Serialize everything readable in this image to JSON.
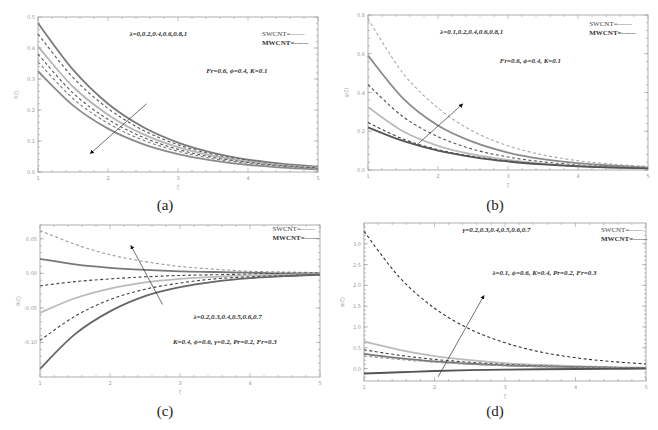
{
  "figure": {
    "panels": [
      {
        "id": "a",
        "caption": "(a)"
      },
      {
        "id": "b",
        "caption": "(b)"
      },
      {
        "id": "c",
        "caption": "(c)"
      },
      {
        "id": "d",
        "caption": "(d)"
      }
    ]
  },
  "chart_data": [
    {
      "panel": "a",
      "type": "line",
      "title": "",
      "xlabel": "ζ",
      "ylabel": "f(ζ)",
      "xlim": [
        1,
        5
      ],
      "ylim": [
        0.0,
        0.5
      ],
      "xticks": [
        "1",
        "2",
        "3",
        "4",
        "5"
      ],
      "yticks": [
        "0.0",
        "0.1",
        "0.2",
        "0.3",
        "0.4",
        "0.5"
      ],
      "annotation_top": "λ=0,0.2,0.4,0.6,0.8,1",
      "annotation_params": "Fr=0.6, ϕ=0.4, K=0.1",
      "legend": [
        "SWCNT=——",
        "MWCNT=------"
      ],
      "arrow": {
        "from": [
          2.55,
          0.22
        ],
        "to": [
          1.75,
          0.06
        ],
        "direction": "decreasing"
      },
      "x": [
        1,
        1.5,
        2,
        2.5,
        3,
        3.5,
        4,
        4.5,
        5
      ],
      "series": [
        {
          "name": "SWCNT λ=0",
          "style": "solid",
          "color": "#7a7a7a",
          "values": [
            0.48,
            0.33,
            0.22,
            0.145,
            0.095,
            0.062,
            0.04,
            0.026,
            0.017
          ]
        },
        {
          "name": "MWCNT λ=0",
          "style": "dashed",
          "color": "#555555",
          "values": [
            0.445,
            0.305,
            0.205,
            0.135,
            0.088,
            0.057,
            0.037,
            0.024,
            0.015
          ]
        },
        {
          "name": "SWCNT λ=0.4",
          "style": "solid",
          "color": "#b5b5b5",
          "values": [
            0.405,
            0.275,
            0.185,
            0.122,
            0.08,
            0.052,
            0.034,
            0.022,
            0.014
          ]
        },
        {
          "name": "MWCNT λ=0.4",
          "style": "dashed",
          "color": "#555555",
          "values": [
            0.38,
            0.255,
            0.17,
            0.112,
            0.073,
            0.047,
            0.031,
            0.02,
            0.013
          ]
        },
        {
          "name": "MWCNT λ=0.8",
          "style": "dashed",
          "color": "#777777",
          "values": [
            0.355,
            0.237,
            0.157,
            0.103,
            0.067,
            0.043,
            0.028,
            0.018,
            0.011
          ]
        },
        {
          "name": "SWCNT λ=1",
          "style": "solid",
          "color": "#8a8a8a",
          "values": [
            0.325,
            0.215,
            0.14,
            0.09,
            0.058,
            0.037,
            0.023,
            0.014,
            0.008
          ]
        }
      ]
    },
    {
      "panel": "b",
      "type": "line",
      "title": "",
      "xlabel": "ζ",
      "ylabel": "g(ζ)",
      "xlim": [
        1,
        5
      ],
      "ylim": [
        0.0,
        0.8
      ],
      "xticks": [
        "1",
        "2",
        "3",
        "4",
        "5"
      ],
      "yticks": [
        "0.0",
        "0.2",
        "0.4",
        "0.6",
        "0.8"
      ],
      "annotation_top": "λ=0.1,0.2,0.4,0.6,0.8,1",
      "annotation_params": "Fr=0.6, ϕ=0.4, K=0.1",
      "legend": [
        "SWCNT=——",
        "MWCNT=------"
      ],
      "arrow": {
        "from": [
          1.7,
          0.13
        ],
        "to": [
          2.35,
          0.34
        ],
        "direction": "increasing"
      },
      "x": [
        1,
        1.5,
        2,
        2.5,
        3,
        3.5,
        4,
        4.5,
        5
      ],
      "series": [
        {
          "name": "MWCNT λ=1",
          "style": "dashed",
          "color": "#aaaaaa",
          "values": [
            0.78,
            0.5,
            0.32,
            0.2,
            0.125,
            0.078,
            0.048,
            0.03,
            0.018
          ]
        },
        {
          "name": "SWCNT λ=1",
          "style": "solid",
          "color": "#8a8a8a",
          "values": [
            0.59,
            0.37,
            0.23,
            0.145,
            0.09,
            0.056,
            0.035,
            0.022,
            0.013
          ]
        },
        {
          "name": "MWCNT λ=0.6",
          "style": "dashed",
          "color": "#555555",
          "values": [
            0.44,
            0.275,
            0.172,
            0.107,
            0.067,
            0.042,
            0.026,
            0.017,
            0.011
          ]
        },
        {
          "name": "SWCNT λ=0.4",
          "style": "solid",
          "color": "#bbbbbb",
          "values": [
            0.325,
            0.2,
            0.125,
            0.08,
            0.052,
            0.033,
            0.021,
            0.014,
            0.009
          ]
        },
        {
          "name": "MWCNT λ=0.2",
          "style": "dashed",
          "color": "#444444",
          "values": [
            0.245,
            0.16,
            0.105,
            0.07,
            0.046,
            0.03,
            0.02,
            0.013,
            0.009
          ]
        },
        {
          "name": "SWCNT λ=0.1",
          "style": "solid",
          "color": "#555555",
          "values": [
            0.22,
            0.15,
            0.1,
            0.067,
            0.044,
            0.029,
            0.019,
            0.013,
            0.008
          ]
        }
      ]
    },
    {
      "panel": "c",
      "type": "line",
      "title": "",
      "xlabel": "ζ",
      "ylabel": "θ(ζ)",
      "xlim": [
        1,
        5
      ],
      "ylim": [
        -0.15,
        0.07
      ],
      "xticks": [
        "1",
        "2",
        "3",
        "4",
        "5"
      ],
      "yticks": [
        "0.05",
        "0.00",
        "-0.05",
        "-0.10"
      ],
      "annotation_top": "λ=0.2,0.3,0.4,0.5,0.6,0.7",
      "annotation_params": "K=0.4, ϕ=0.6, γ=0.2, Pr=0.2, Fr=0.3",
      "legend": [
        "SWCNT=——",
        "MWCNT=------"
      ],
      "arrow": {
        "from": [
          2.75,
          -0.045
        ],
        "to": [
          2.3,
          0.04
        ],
        "direction": "increasing"
      },
      "x": [
        1,
        1.5,
        2,
        2.5,
        3,
        3.5,
        4,
        4.5,
        5
      ],
      "series": [
        {
          "name": "MWCNT λ=0.7",
          "style": "dashed",
          "color": "#999999",
          "values": [
            0.062,
            0.042,
            0.027,
            0.017,
            0.01,
            0.006,
            0.003,
            0.002,
            0.001
          ]
        },
        {
          "name": "SWCNT λ=0.6",
          "style": "solid",
          "color": "#777777",
          "values": [
            0.021,
            0.013,
            0.008,
            0.005,
            0.003,
            0.002,
            0.001,
            0.0,
            0.0
          ]
        },
        {
          "name": "MWCNT λ=0.5",
          "style": "dashed",
          "color": "#444444",
          "values": [
            -0.018,
            -0.012,
            -0.008,
            -0.005,
            -0.003,
            -0.002,
            -0.001,
            0.0,
            0.0
          ]
        },
        {
          "name": "SWCNT λ=0.4",
          "style": "solid",
          "color": "#bbbbbb",
          "values": [
            -0.057,
            -0.036,
            -0.022,
            -0.013,
            -0.008,
            -0.005,
            -0.003,
            -0.002,
            -0.001
          ]
        },
        {
          "name": "MWCNT λ=0.3",
          "style": "dashed",
          "color": "#444444",
          "values": [
            -0.097,
            -0.062,
            -0.038,
            -0.023,
            -0.014,
            -0.008,
            -0.005,
            -0.003,
            -0.002
          ]
        },
        {
          "name": "SWCNT λ=0.2",
          "style": "solid",
          "color": "#666666",
          "values": [
            -0.138,
            -0.088,
            -0.055,
            -0.033,
            -0.02,
            -0.012,
            -0.007,
            -0.004,
            -0.002
          ]
        }
      ]
    },
    {
      "panel": "d",
      "type": "line",
      "title": "",
      "xlabel": "ζ",
      "ylabel": "ϕ(ζ)",
      "xlim": [
        1,
        5
      ],
      "ylim": [
        -0.3,
        3.5
      ],
      "xticks": [
        "1",
        "2",
        "3",
        "4",
        "5"
      ],
      "yticks": [
        "0.0",
        "0.5",
        "1.0",
        "1.5",
        "2.0",
        "2.5",
        "3.0"
      ],
      "annotation_top": "γ=0.2,0.3,0.4,0.5,0.6,0.7",
      "annotation_params": "λ=0.1, ϕ=0.6, K=0.4, Pr=0.2, Fr=0.3",
      "legend": [
        "SWCNT=——",
        "MWCNT=------"
      ],
      "arrow": {
        "from": [
          2.05,
          -0.2
        ],
        "to": [
          2.7,
          1.75
        ],
        "direction": "increasing"
      },
      "x": [
        1,
        1.5,
        2,
        2.5,
        3,
        3.5,
        4,
        4.5,
        5
      ],
      "series": [
        {
          "name": "MWCNT γ=0.7",
          "style": "dashed",
          "color": "#333333",
          "values": [
            3.3,
            2.2,
            1.45,
            0.95,
            0.62,
            0.4,
            0.26,
            0.17,
            0.11
          ]
        },
        {
          "name": "SWCNT γ=0.6",
          "style": "solid",
          "color": "#bbbbbb",
          "values": [
            0.65,
            0.45,
            0.3,
            0.2,
            0.13,
            0.085,
            0.055,
            0.035,
            0.022
          ]
        },
        {
          "name": "MWCNT γ=0.5",
          "style": "dashed",
          "color": "#444444",
          "values": [
            0.45,
            0.32,
            0.22,
            0.15,
            0.1,
            0.065,
            0.042,
            0.027,
            0.017
          ]
        },
        {
          "name": "SWCNT γ=0.4",
          "style": "solid",
          "color": "#777777",
          "values": [
            0.35,
            0.25,
            0.17,
            0.115,
            0.075,
            0.05,
            0.032,
            0.02,
            0.013
          ]
        },
        {
          "name": "MWCNT γ=0.3",
          "style": "dashed",
          "color": "#999999",
          "values": [
            0.3,
            0.22,
            0.15,
            0.1,
            0.066,
            0.043,
            0.028,
            0.018,
            0.011
          ]
        },
        {
          "name": "SWCNT γ=0.2",
          "style": "solid",
          "color": "#555555",
          "values": [
            -0.12,
            -0.09,
            -0.06,
            -0.04,
            -0.026,
            -0.017,
            -0.011,
            -0.007,
            -0.004
          ]
        }
      ]
    }
  ]
}
